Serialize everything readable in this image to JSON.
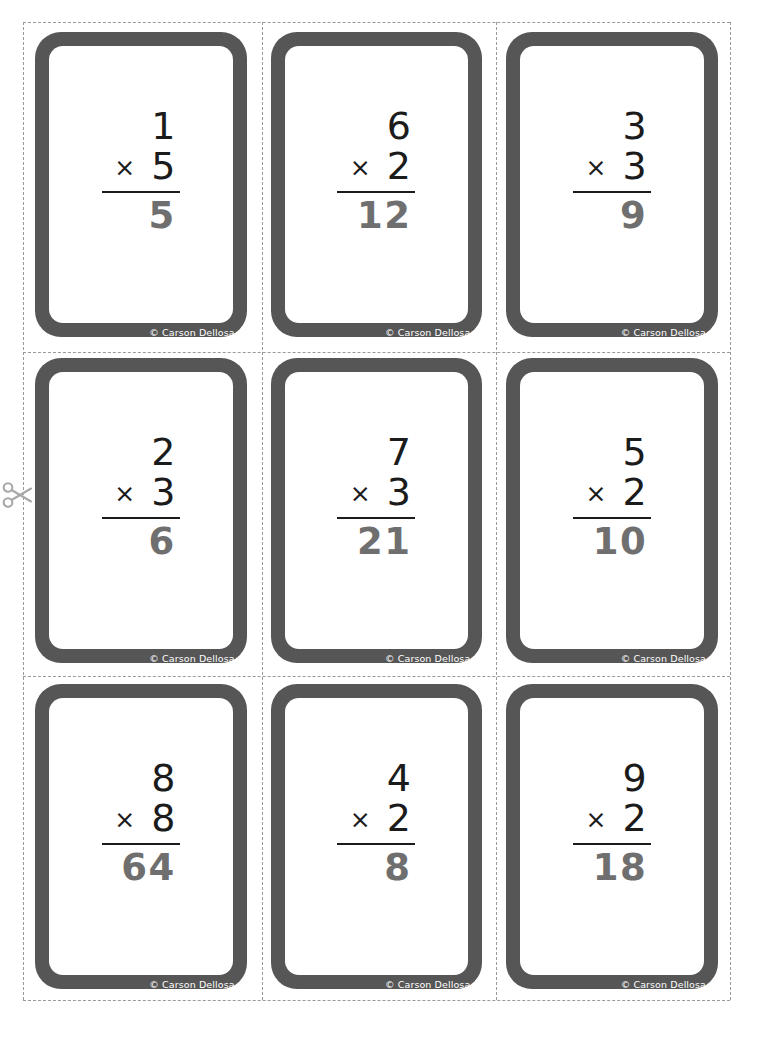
{
  "sheet": {
    "title": "Multiplication Flash Cards",
    "copyright": "© Carson Dellosa",
    "operator_symbol": "×",
    "border_color": "#565656",
    "operand_color": "#1b1b1b",
    "answer_color": "#6f6f6f",
    "cut_line_color": "#9a9a9a",
    "scissors_icon": "scissors-icon"
  },
  "cards": [
    {
      "top": "1",
      "op": "×",
      "bottom": "5",
      "answer": "5",
      "copyright": "© Carson Dellosa"
    },
    {
      "top": "6",
      "op": "×",
      "bottom": "2",
      "answer": "12",
      "copyright": "© Carson Dellosa"
    },
    {
      "top": "3",
      "op": "×",
      "bottom": "3",
      "answer": "9",
      "copyright": "© Carson Dellosa"
    },
    {
      "top": "2",
      "op": "×",
      "bottom": "3",
      "answer": "6",
      "copyright": "© Carson Dellosa"
    },
    {
      "top": "7",
      "op": "×",
      "bottom": "3",
      "answer": "21",
      "copyright": "© Carson Dellosa"
    },
    {
      "top": "5",
      "op": "×",
      "bottom": "2",
      "answer": "10",
      "copyright": "© Carson Dellosa"
    },
    {
      "top": "8",
      "op": "×",
      "bottom": "8",
      "answer": "64",
      "copyright": "© Carson Dellosa"
    },
    {
      "top": "4",
      "op": "×",
      "bottom": "2",
      "answer": "8",
      "copyright": "© Carson Dellosa"
    },
    {
      "top": "9",
      "op": "×",
      "bottom": "2",
      "answer": "18",
      "copyright": "© Carson Dellosa"
    }
  ]
}
